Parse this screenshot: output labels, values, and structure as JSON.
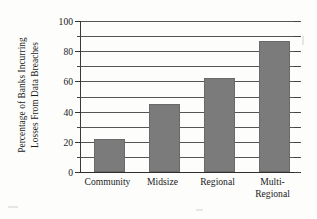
{
  "chart_data": {
    "type": "bar",
    "title": "",
    "xlabel": "",
    "ylabel": "Percentage of Banks Incurring Losses From Data Breaches",
    "ylabel_lines": [
      "Percentage of Banks Incurring",
      "Losses From Data Breaches"
    ],
    "categories": [
      "Community",
      "Midsize",
      "Regional",
      "Multi-Regional"
    ],
    "category_lines": [
      [
        "Community"
      ],
      [
        "Midsize"
      ],
      [
        "Regional"
      ],
      [
        "Multi-",
        "Regional"
      ]
    ],
    "values": [
      22,
      45,
      62,
      87
    ],
    "ylim": [
      0,
      100
    ],
    "ytick_labels": [
      "0",
      "20",
      "40",
      "60",
      "80",
      "100"
    ],
    "ytick_values": [
      0,
      20,
      40,
      60,
      80,
      100
    ],
    "minor_tick_values": [
      10,
      30,
      50,
      70,
      90
    ],
    "gridline_values": [
      0,
      10,
      20,
      30,
      40,
      50,
      60,
      70,
      80,
      90,
      100
    ],
    "grid": true,
    "legend": "none",
    "bar_color": "#7b7b7b",
    "axis_color": "#333333",
    "grid_color": "#555555",
    "background_color": "#fdfdfc"
  }
}
